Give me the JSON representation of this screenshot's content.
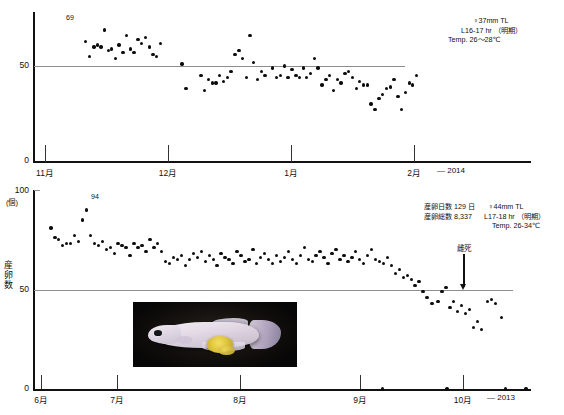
{
  "figure": {
    "title": "",
    "axis_title_y": "産卵数",
    "unit_label": "(個)"
  },
  "top_panel": {
    "year_label": "— 2014",
    "y_ticks": [
      "50",
      "0"
    ],
    "x_ticks": [
      "11月",
      "12月",
      "1月",
      "2月"
    ],
    "peak_annotation": "69",
    "notes": [
      "♀37mm TL",
      "L16-17 hr （明期）",
      "Temp. 26～28℃"
    ]
  },
  "bottom_panel": {
    "year_label": "— 2013",
    "y_ticks": [
      "100",
      "50",
      "0"
    ],
    "unit": "(個)",
    "x_ticks": [
      "6月",
      "7月",
      "8月",
      "9月",
      "10月"
    ],
    "peak_annotation": "94",
    "death_label": "雌死",
    "notes_left": [
      "産卵日数 129 日",
      "産卵総数 8,337"
    ],
    "notes_right": [
      "♀44mm TL",
      "L17-18 hr （明期）",
      "Temp. 26-34℃"
    ],
    "photo_caption": ""
  },
  "chart_data": {
    "type": "scatter",
    "ylabel": "産卵数",
    "yunit": "(個)",
    "panels": [
      {
        "name": "top",
        "xlabel": "",
        "year": "— 2014",
        "ylim": [
          0,
          100
        ],
        "grid": "single line at y=50",
        "gridline_y": 50,
        "xtick_labels": [
          "11月",
          "12月",
          "1月",
          "2月"
        ],
        "xtick_positions": [
          0.105,
          0.34,
          0.575,
          0.81
        ],
        "annotations": [
          {
            "text": "69",
            "x": 0.175,
            "y": 69
          }
        ],
        "notes": [
          "♀37mm TL",
          "L16-17 hr （明期）",
          "Temp. 26～28℃"
        ],
        "points": [
          {
            "x": 0.1,
            "y": 63
          },
          {
            "x": 0.108,
            "y": 55
          },
          {
            "x": 0.117,
            "y": 60
          },
          {
            "x": 0.124,
            "y": 61
          },
          {
            "x": 0.131,
            "y": 60
          },
          {
            "x": 0.139,
            "y": 69
          },
          {
            "x": 0.147,
            "y": 58
          },
          {
            "x": 0.153,
            "y": 59
          },
          {
            "x": 0.16,
            "y": 54
          },
          {
            "x": 0.168,
            "y": 61
          },
          {
            "x": 0.176,
            "y": 57
          },
          {
            "x": 0.183,
            "y": 66
          },
          {
            "x": 0.191,
            "y": 59
          },
          {
            "x": 0.198,
            "y": 57
          },
          {
            "x": 0.206,
            "y": 64
          },
          {
            "x": 0.213,
            "y": 62
          },
          {
            "x": 0.221,
            "y": 65
          },
          {
            "x": 0.229,
            "y": 60
          },
          {
            "x": 0.236,
            "y": 56
          },
          {
            "x": 0.244,
            "y": 55
          },
          {
            "x": 0.252,
            "y": 62
          },
          {
            "x": 0.295,
            "y": 51
          },
          {
            "x": 0.303,
            "y": 38
          },
          {
            "x": 0.333,
            "y": 45
          },
          {
            "x": 0.341,
            "y": 37
          },
          {
            "x": 0.348,
            "y": 43
          },
          {
            "x": 0.356,
            "y": 41
          },
          {
            "x": 0.364,
            "y": 41
          },
          {
            "x": 0.371,
            "y": 45
          },
          {
            "x": 0.379,
            "y": 42
          },
          {
            "x": 0.387,
            "y": 44
          },
          {
            "x": 0.394,
            "y": 47
          },
          {
            "x": 0.402,
            "y": 56
          },
          {
            "x": 0.41,
            "y": 58
          },
          {
            "x": 0.417,
            "y": 54
          },
          {
            "x": 0.425,
            "y": 44
          },
          {
            "x": 0.432,
            "y": 66
          },
          {
            "x": 0.44,
            "y": 52
          },
          {
            "x": 0.448,
            "y": 43
          },
          {
            "x": 0.455,
            "y": 47
          },
          {
            "x": 0.463,
            "y": 45
          },
          {
            "x": 0.478,
            "y": 49
          },
          {
            "x": 0.486,
            "y": 44
          },
          {
            "x": 0.494,
            "y": 45
          },
          {
            "x": 0.502,
            "y": 50
          },
          {
            "x": 0.509,
            "y": 44
          },
          {
            "x": 0.517,
            "y": 48
          },
          {
            "x": 0.525,
            "y": 45
          },
          {
            "x": 0.532,
            "y": 44
          },
          {
            "x": 0.54,
            "y": 49
          },
          {
            "x": 0.547,
            "y": 44
          },
          {
            "x": 0.555,
            "y": 46
          },
          {
            "x": 0.563,
            "y": 54
          },
          {
            "x": 0.57,
            "y": 49
          },
          {
            "x": 0.578,
            "y": 40
          },
          {
            "x": 0.586,
            "y": 43
          },
          {
            "x": 0.593,
            "y": 45
          },
          {
            "x": 0.601,
            "y": 37
          },
          {
            "x": 0.609,
            "y": 43
          },
          {
            "x": 0.616,
            "y": 41
          },
          {
            "x": 0.624,
            "y": 46
          },
          {
            "x": 0.631,
            "y": 47
          },
          {
            "x": 0.639,
            "y": 44
          },
          {
            "x": 0.647,
            "y": 38
          },
          {
            "x": 0.654,
            "y": 42
          },
          {
            "x": 0.662,
            "y": 40
          },
          {
            "x": 0.67,
            "y": 40
          },
          {
            "x": 0.677,
            "y": 30
          },
          {
            "x": 0.685,
            "y": 27
          },
          {
            "x": 0.693,
            "y": 33
          },
          {
            "x": 0.7,
            "y": 35
          },
          {
            "x": 0.708,
            "y": 38
          },
          {
            "x": 0.716,
            "y": 39
          },
          {
            "x": 0.723,
            "y": 43
          },
          {
            "x": 0.731,
            "y": 34
          },
          {
            "x": 0.738,
            "y": 27
          },
          {
            "x": 0.746,
            "y": 36
          },
          {
            "x": 0.754,
            "y": 41
          },
          {
            "x": 0.761,
            "y": 40
          },
          {
            "x": 0.769,
            "y": 45
          }
        ]
      },
      {
        "name": "bottom",
        "xlabel": "",
        "year": "— 2013",
        "ylim": [
          0,
          100
        ],
        "grid": "single line at y=50",
        "gridline_y": 50,
        "xtick_labels": [
          "6月",
          "7月",
          "8月",
          "9月",
          "10月"
        ],
        "xtick_positions": [
          0.02,
          0.175,
          0.425,
          0.665,
          0.875
        ],
        "annotations": [
          {
            "text": "94",
            "x": 0.105,
            "y": 94
          },
          {
            "text": "雌死",
            "x": 0.815,
            "y": 62
          }
        ],
        "notes_left": [
          "産卵日数 129 日",
          "産卵総数 8,337"
        ],
        "notes_right": [
          "♀44mm TL",
          "L17-18 hr （明期）",
          "Temp. 26-34℃"
        ],
        "points": [
          {
            "x": 0.03,
            "y": 81
          },
          {
            "x": 0.038,
            "y": 76
          },
          {
            "x": 0.046,
            "y": 75
          },
          {
            "x": 0.054,
            "y": 72
          },
          {
            "x": 0.062,
            "y": 73
          },
          {
            "x": 0.07,
            "y": 73
          },
          {
            "x": 0.078,
            "y": 77
          },
          {
            "x": 0.086,
            "y": 74
          },
          {
            "x": 0.094,
            "y": 85
          },
          {
            "x": 0.102,
            "y": 90
          },
          {
            "x": 0.11,
            "y": 77
          },
          {
            "x": 0.118,
            "y": 73
          },
          {
            "x": 0.126,
            "y": 72
          },
          {
            "x": 0.134,
            "y": 74
          },
          {
            "x": 0.142,
            "y": 70
          },
          {
            "x": 0.15,
            "y": 71
          },
          {
            "x": 0.158,
            "y": 68
          },
          {
            "x": 0.166,
            "y": 73
          },
          {
            "x": 0.174,
            "y": 72
          },
          {
            "x": 0.182,
            "y": 71
          },
          {
            "x": 0.19,
            "y": 67
          },
          {
            "x": 0.198,
            "y": 73
          },
          {
            "x": 0.206,
            "y": 71
          },
          {
            "x": 0.214,
            "y": 72
          },
          {
            "x": 0.222,
            "y": 69
          },
          {
            "x": 0.23,
            "y": 75
          },
          {
            "x": 0.238,
            "y": 71
          },
          {
            "x": 0.246,
            "y": 73
          },
          {
            "x": 0.254,
            "y": 69
          },
          {
            "x": 0.262,
            "y": 64
          },
          {
            "x": 0.27,
            "y": 63
          },
          {
            "x": 0.278,
            "y": 66
          },
          {
            "x": 0.286,
            "y": 65
          },
          {
            "x": 0.294,
            "y": 67
          },
          {
            "x": 0.302,
            "y": 62
          },
          {
            "x": 0.31,
            "y": 65
          },
          {
            "x": 0.318,
            "y": 68
          },
          {
            "x": 0.326,
            "y": 66
          },
          {
            "x": 0.334,
            "y": 69
          },
          {
            "x": 0.342,
            "y": 64
          },
          {
            "x": 0.35,
            "y": 67
          },
          {
            "x": 0.358,
            "y": 65
          },
          {
            "x": 0.366,
            "y": 62
          },
          {
            "x": 0.374,
            "y": 68
          },
          {
            "x": 0.382,
            "y": 66
          },
          {
            "x": 0.39,
            "y": 65
          },
          {
            "x": 0.398,
            "y": 63
          },
          {
            "x": 0.406,
            "y": 69
          },
          {
            "x": 0.414,
            "y": 67
          },
          {
            "x": 0.422,
            "y": 64
          },
          {
            "x": 0.43,
            "y": 65
          },
          {
            "x": 0.438,
            "y": 70
          },
          {
            "x": 0.446,
            "y": 63
          },
          {
            "x": 0.454,
            "y": 66
          },
          {
            "x": 0.462,
            "y": 68
          },
          {
            "x": 0.47,
            "y": 65
          },
          {
            "x": 0.478,
            "y": 63
          },
          {
            "x": 0.486,
            "y": 67
          },
          {
            "x": 0.494,
            "y": 64
          },
          {
            "x": 0.502,
            "y": 66
          },
          {
            "x": 0.51,
            "y": 69
          },
          {
            "x": 0.518,
            "y": 65
          },
          {
            "x": 0.526,
            "y": 63
          },
          {
            "x": 0.534,
            "y": 67
          },
          {
            "x": 0.542,
            "y": 71
          },
          {
            "x": 0.55,
            "y": 65
          },
          {
            "x": 0.558,
            "y": 64
          },
          {
            "x": 0.566,
            "y": 67
          },
          {
            "x": 0.574,
            "y": 69
          },
          {
            "x": 0.582,
            "y": 66
          },
          {
            "x": 0.59,
            "y": 63
          },
          {
            "x": 0.598,
            "y": 68
          },
          {
            "x": 0.606,
            "y": 70
          },
          {
            "x": 0.614,
            "y": 65
          },
          {
            "x": 0.622,
            "y": 67
          },
          {
            "x": 0.63,
            "y": 64
          },
          {
            "x": 0.638,
            "y": 66
          },
          {
            "x": 0.646,
            "y": 69
          },
          {
            "x": 0.654,
            "y": 65
          },
          {
            "x": 0.662,
            "y": 63
          },
          {
            "x": 0.67,
            "y": 67
          },
          {
            "x": 0.678,
            "y": 70
          },
          {
            "x": 0.686,
            "y": 65
          },
          {
            "x": 0.694,
            "y": 64
          },
          {
            "x": 0.702,
            "y": 63
          },
          {
            "x": 0.71,
            "y": 66
          },
          {
            "x": 0.718,
            "y": 62
          },
          {
            "x": 0.726,
            "y": 58
          },
          {
            "x": 0.734,
            "y": 60
          },
          {
            "x": 0.742,
            "y": 56
          },
          {
            "x": 0.75,
            "y": 57
          },
          {
            "x": 0.758,
            "y": 55
          },
          {
            "x": 0.766,
            "y": 52
          },
          {
            "x": 0.774,
            "y": 54
          },
          {
            "x": 0.782,
            "y": 49
          },
          {
            "x": 0.79,
            "y": 46
          },
          {
            "x": 0.8,
            "y": 43
          },
          {
            "x": 0.812,
            "y": 44
          },
          {
            "x": 0.82,
            "y": 49
          },
          {
            "x": 0.828,
            "y": 51
          },
          {
            "x": 0.836,
            "y": 41
          },
          {
            "x": 0.844,
            "y": 44
          },
          {
            "x": 0.852,
            "y": 39
          },
          {
            "x": 0.86,
            "y": 42
          },
          {
            "x": 0.868,
            "y": 38
          },
          {
            "x": 0.876,
            "y": 40
          },
          {
            "x": 0.884,
            "y": 31
          },
          {
            "x": 0.892,
            "y": 34
          },
          {
            "x": 0.9,
            "y": 30
          },
          {
            "x": 0.912,
            "y": 44
          },
          {
            "x": 0.92,
            "y": 45
          },
          {
            "x": 0.928,
            "y": 43
          },
          {
            "x": 0.94,
            "y": 36
          },
          {
            "x": 0.948,
            "y": 0
          },
          {
            "x": 0.7,
            "y": 0
          },
          {
            "x": 0.83,
            "y": 0
          },
          {
            "x": 0.99,
            "y": 0
          }
        ]
      }
    ]
  }
}
